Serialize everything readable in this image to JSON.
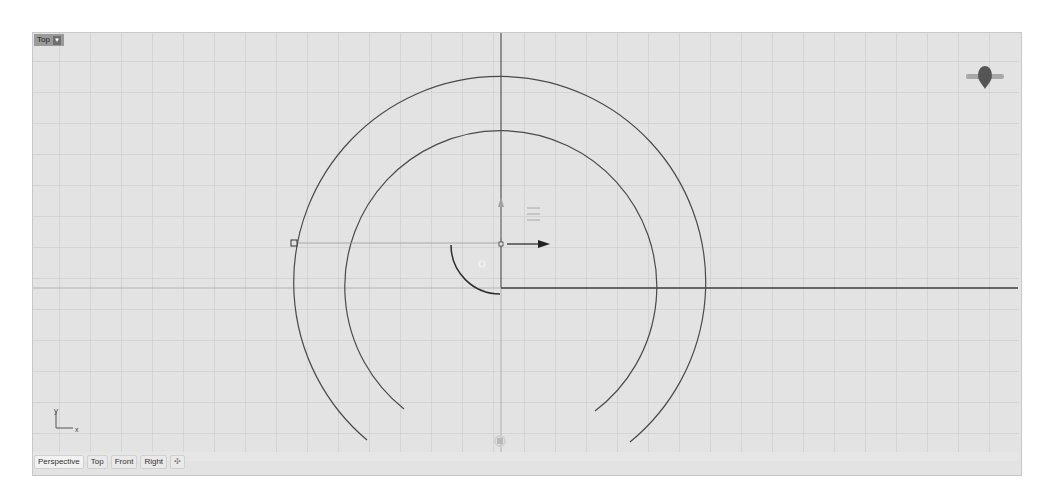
{
  "viewport": {
    "name": "Top",
    "label_dropdown_icon": "caret-down-icon",
    "grid_spacing_px": 31,
    "background_color": "#e3e3e3",
    "grid_color": "#c9c9c9",
    "curve_color": "#4a4a4a",
    "axis_label_x": "x",
    "axis_label_y": "y"
  },
  "tabs": [
    {
      "label": "Perspective",
      "active": true
    },
    {
      "label": "Top",
      "active": false
    },
    {
      "label": "Front",
      "active": false
    },
    {
      "label": "Right",
      "active": false
    }
  ],
  "add_tab_icon": "plus-icon",
  "gizmos": {
    "navigation_widget": "view-cube-icon",
    "gumball_menu": "menu-icon",
    "gumball_x_arrow": "arrow-right-icon",
    "gumball_y_arrow": "arrow-up-icon"
  }
}
